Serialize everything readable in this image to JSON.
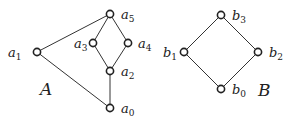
{
  "diagrams": [
    {
      "name": "A",
      "label": "A",
      "label_pos": [
        40,
        95
      ],
      "nodes": [
        {
          "id": "a0",
          "base": "a",
          "sub": "0",
          "x": 110,
          "y": 108,
          "lx": 121,
          "ly": 113
        },
        {
          "id": "a1",
          "base": "a",
          "sub": "1",
          "x": 37,
          "y": 52,
          "lx": 8,
          "ly": 57
        },
        {
          "id": "a2",
          "base": "a",
          "sub": "2",
          "x": 110,
          "y": 71,
          "lx": 121,
          "ly": 76
        },
        {
          "id": "a3",
          "base": "a",
          "sub": "3",
          "x": 93,
          "y": 43,
          "lx": 74,
          "ly": 48
        },
        {
          "id": "a4",
          "base": "a",
          "sub": "4",
          "x": 128,
          "y": 43,
          "lx": 138,
          "ly": 48
        },
        {
          "id": "a5",
          "base": "a",
          "sub": "5",
          "x": 110,
          "y": 14,
          "lx": 121,
          "ly": 19
        }
      ],
      "edges": [
        [
          "a1",
          "a5"
        ],
        [
          "a1",
          "a0"
        ],
        [
          "a5",
          "a3"
        ],
        [
          "a5",
          "a4"
        ],
        [
          "a3",
          "a2"
        ],
        [
          "a4",
          "a2"
        ],
        [
          "a2",
          "a0"
        ]
      ]
    },
    {
      "name": "B",
      "label": "B",
      "label_pos": [
        258,
        96
      ],
      "nodes": [
        {
          "id": "b0",
          "base": "b",
          "sub": "0",
          "x": 221,
          "y": 89,
          "lx": 232,
          "ly": 94
        },
        {
          "id": "b1",
          "base": "b",
          "sub": "1",
          "x": 184,
          "y": 52,
          "lx": 163,
          "ly": 57
        },
        {
          "id": "b2",
          "base": "b",
          "sub": "2",
          "x": 258,
          "y": 52,
          "lx": 269,
          "ly": 57
        },
        {
          "id": "b3",
          "base": "b",
          "sub": "3",
          "x": 221,
          "y": 15,
          "lx": 232,
          "ly": 20
        }
      ],
      "edges": [
        [
          "b3",
          "b1"
        ],
        [
          "b3",
          "b2"
        ],
        [
          "b1",
          "b0"
        ],
        [
          "b2",
          "b0"
        ]
      ]
    }
  ]
}
